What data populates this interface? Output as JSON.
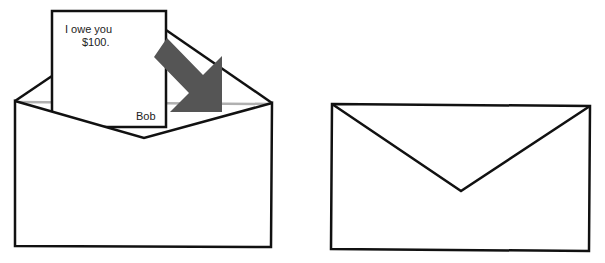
{
  "figure": {
    "left_panel": {
      "description": "Open envelope with IOU note being inserted",
      "note": {
        "line1": "I owe you",
        "line2": "$100.",
        "signature": "Bob"
      },
      "arrow": {
        "color": "#555555",
        "direction": "down-right"
      }
    },
    "right_panel": {
      "description": "Sealed envelope"
    },
    "colors": {
      "stroke": "#111111",
      "fill": "#ffffff",
      "envelope_inner_edge": "#b0b0b0",
      "arrow": "#555555"
    }
  }
}
